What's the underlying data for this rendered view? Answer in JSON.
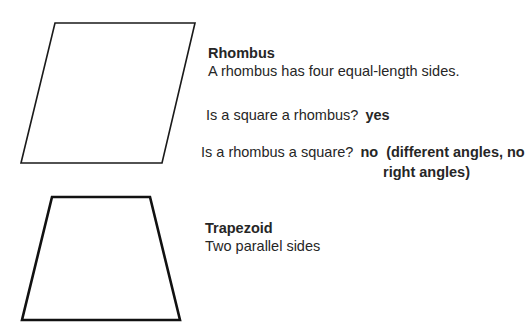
{
  "rhombus": {
    "title": "Rhombus",
    "description": "A rhombus has four equal-length sides.",
    "q1": {
      "question": "Is a square a rhombus?",
      "answer": "yes"
    },
    "q2": {
      "question": "Is a rhombus a square?",
      "answer_line1": "no  (different angles, no",
      "answer_line2": "right angles)"
    },
    "points": "55,23 195,23 162,163 21,163"
  },
  "trapezoid": {
    "title": "Trapezoid",
    "description": "Two parallel sides",
    "points": "52,197 150,197 180,320 22,320"
  }
}
